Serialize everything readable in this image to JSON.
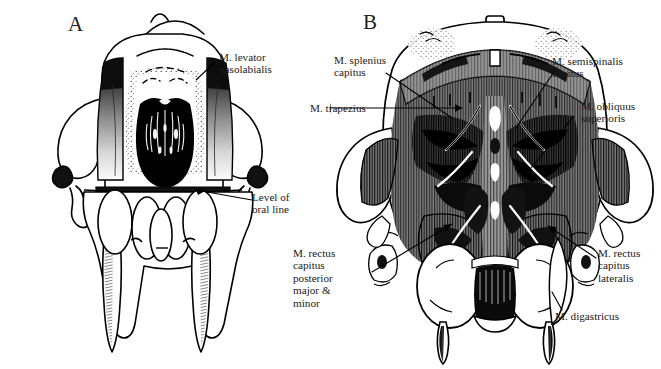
{
  "figure": {
    "background_color": "#ffffff",
    "ink_color": "#000000",
    "muscle_fill_color": "#808080",
    "panels": [
      {
        "id": "A",
        "letter": "A",
        "subject": "ventral view of skull with M. levator nasolabialis",
        "labels": [
          {
            "name": "m-levator-nasolabialis",
            "text": "M. levator\nnasolabialis"
          },
          {
            "name": "level-of-oral-line",
            "text": "Level of\noral line"
          }
        ]
      },
      {
        "id": "B",
        "letter": "B",
        "subject": "posterior view of skull with neck musculature",
        "labels": [
          {
            "name": "m-splenius-capitus",
            "text": "M. splenius\ncapitus"
          },
          {
            "name": "m-semispinalis-capitus",
            "text": "M. semispinalis\ncapitus"
          },
          {
            "name": "m-trapezius",
            "text": "M. trapezius"
          },
          {
            "name": "m-obliquus-superioris",
            "text": "M. obliquus\nsuperioris"
          },
          {
            "name": "m-rectus-capitus-posterior-major-minor",
            "text": "M. rectus\ncapitus\nposterior\nmajor &\nminor"
          },
          {
            "name": "m-rectus-capitus-lateralis",
            "text": "M. rectus\ncapitus\nlateralis"
          },
          {
            "name": "m-digastricus",
            "text": "M. digastricus"
          }
        ]
      }
    ]
  }
}
